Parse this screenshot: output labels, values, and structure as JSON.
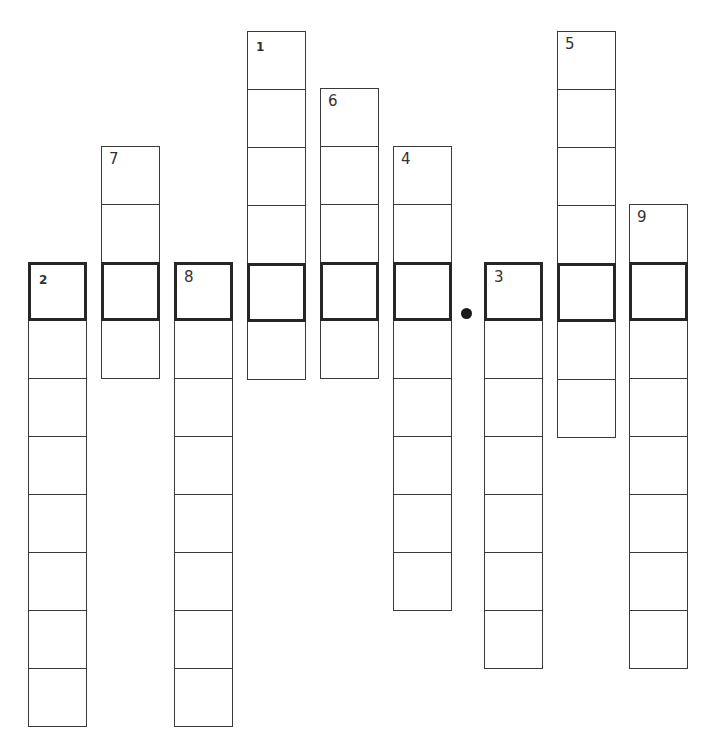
{
  "puzzle": {
    "type": "vertical-word-ladder-crossword",
    "key_row_description": "Highlighted row of 9 bold cells forms a hidden phrase, split by a dot after the 6th letter",
    "cell_size": 58,
    "key_row_top": 262,
    "border_color": "#3a3a3a",
    "key_border_color": "#262626",
    "background": "#ffffff",
    "columns": [
      {
        "clue": "2",
        "left": 28,
        "top": 262,
        "cells": 8,
        "key_index": 0,
        "number_style": "small"
      },
      {
        "clue": "7",
        "left": 101,
        "top": 146,
        "cells": 4,
        "key_index": 2,
        "number_style": "normal"
      },
      {
        "clue": "8",
        "left": 174,
        "top": 262,
        "cells": 8,
        "key_index": 0,
        "number_style": "normal"
      },
      {
        "clue": "1",
        "left": 247,
        "top": 31,
        "cells": 6,
        "key_index": 4,
        "number_style": "small"
      },
      {
        "clue": "6",
        "left": 320,
        "top": 88,
        "cells": 5,
        "key_index": 3,
        "number_style": "normal"
      },
      {
        "clue": "4",
        "left": 393,
        "top": 146,
        "cells": 8,
        "key_index": 2,
        "number_style": "normal"
      },
      {
        "clue": "3",
        "left": 484,
        "top": 262,
        "cells": 7,
        "key_index": 0,
        "number_style": "normal"
      },
      {
        "clue": "5",
        "left": 557,
        "top": 31,
        "cells": 7,
        "key_index": 4,
        "number_style": "normal"
      },
      {
        "clue": "9",
        "left": 629,
        "top": 204,
        "cells": 8,
        "key_index": 1,
        "number_style": "normal"
      }
    ],
    "separator": {
      "symbol": "dot",
      "left": 461,
      "top": 308
    },
    "entries": {
      "2": "",
      "7": "",
      "8": "",
      "1": "",
      "6": "",
      "4": "",
      "3": "",
      "5": "",
      "9": ""
    }
  }
}
